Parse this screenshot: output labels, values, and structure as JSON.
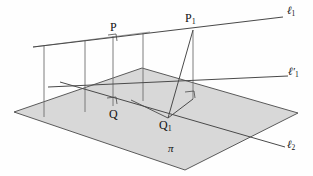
{
  "figure": {
    "kind": "geometry-diagram",
    "width": 313,
    "height": 176,
    "background": "#fefefe"
  },
  "style": {
    "stroke_dark": "#3c3c3c",
    "stroke_mid": "#6a6a6a",
    "stroke_light": "#8c8c8c",
    "plane_fill": "#c9c9c9",
    "plane_fill_opacity": 0.72,
    "plane_edge": "#4a4a4a",
    "label_color": "#111111"
  },
  "labels": {
    "line_l1": "ℓ",
    "line_l1_sub": "1",
    "line_l1prime": "ℓ′",
    "line_l1prime_sub": "1",
    "line_l2": "ℓ",
    "line_l2_sub": "2",
    "plane": "π",
    "point_P": "P",
    "point_P1": "P",
    "point_P1_sub": "1",
    "point_Q": "Q",
    "point_Q1": "Q",
    "point_Q1_sub": "1"
  },
  "geometry": {
    "plane_polygon": "14,112 142,68 298,113 185,170",
    "line_l1": {
      "x1": 33,
      "y1": 47,
      "x2": 283,
      "y2": 17
    },
    "line_l1_prime": {
      "x1": 48,
      "y1": 87,
      "x2": 288,
      "y2": 76
    },
    "line_l2": {
      "x1": 60,
      "y1": 82,
      "x2": 285,
      "y2": 147
    },
    "verticals": [
      {
        "x": 44,
        "y1": 45,
        "y2": 117
      },
      {
        "x": 85,
        "y1": 40,
        "y2": 112
      },
      {
        "x": 113,
        "y1": 36,
        "y2": 106
      },
      {
        "x": 143,
        "y1": 33,
        "y2": 101
      },
      {
        "x": 193,
        "y1": 30,
        "y2": 99
      }
    ],
    "segment_P1_Q1": {
      "x1": 193,
      "y1": 30,
      "x2": 168,
      "y2": 118
    },
    "segment_Q1_foot": {
      "x1": 168,
      "y1": 118,
      "x2": 193,
      "y2": 99
    },
    "segment_Q1_left": {
      "x1": 168,
      "y1": 118,
      "x2": 133,
      "y2": 101
    },
    "right_angle_marks": [
      {
        "x": 110,
        "y": 36,
        "note": "at P on line l1"
      },
      {
        "x": 110,
        "y": 98,
        "note": "at Q on line l1 prime"
      },
      {
        "x": 187,
        "y": 92,
        "note": "at foot of P1 perpendicular"
      }
    ]
  },
  "label_positions": {
    "line_l1": {
      "left": 287,
      "top": 6
    },
    "line_l1_prime": {
      "left": 289,
      "top": 67
    },
    "line_l2": {
      "left": 288,
      "top": 140
    },
    "plane": {
      "left": 168,
      "top": 143
    },
    "point_P": {
      "left": 111,
      "top": 22
    },
    "point_P1": {
      "left": 186,
      "top": 13
    },
    "point_Q": {
      "left": 110,
      "top": 109
    },
    "point_Q1": {
      "left": 160,
      "top": 120
    }
  }
}
